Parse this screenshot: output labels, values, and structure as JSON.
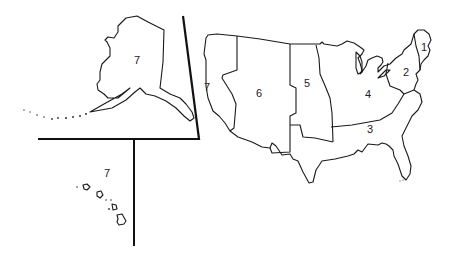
{
  "map": {
    "type": "US time/region zone map",
    "colors": {
      "stroke": "#1a1a1a",
      "background": "#ffffff"
    },
    "regions": [
      {
        "id": "region-1",
        "label": "1",
        "x": 421,
        "y": 42
      },
      {
        "id": "region-2",
        "label": "2",
        "x": 403,
        "y": 67
      },
      {
        "id": "region-3",
        "label": "3",
        "x": 367,
        "y": 124
      },
      {
        "id": "region-4",
        "label": "4",
        "x": 365,
        "y": 89
      },
      {
        "id": "region-5",
        "label": "5",
        "x": 304,
        "y": 78
      },
      {
        "id": "region-6",
        "label": "6",
        "x": 256,
        "y": 88
      },
      {
        "id": "region-7-west",
        "label": "7",
        "x": 204,
        "y": 82
      }
    ],
    "insets": {
      "alaska": {
        "label": "7",
        "x": 134,
        "y": 55
      },
      "hawaii": {
        "label": "7",
        "x": 104,
        "y": 168
      }
    }
  }
}
